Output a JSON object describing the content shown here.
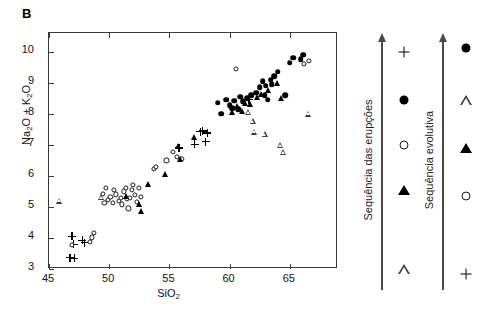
{
  "panel": {
    "label": "B"
  },
  "chart_data": {
    "type": "scatter",
    "title": "",
    "xlabel": "SiO2",
    "ylabel": "Na2O + K2O",
    "xlabel_html": "SiO<sub>2</sub>",
    "ylabel_html": "Na<sub>2</sub>O + K<sub>2</sub>O",
    "xlim": [
      45,
      69
    ],
    "ylim": [
      3,
      10.6
    ],
    "xticks": [
      45,
      50,
      55,
      60,
      65
    ],
    "yticks": [
      3,
      4,
      5,
      6,
      7,
      8,
      9,
      10
    ],
    "grid": false,
    "legend_position": "right-outside",
    "series": [
      {
        "name": "plus",
        "marker": "plus",
        "points": [
          [
            46.9,
            4.05
          ],
          [
            47.05,
            3.8
          ],
          [
            46.75,
            3.37
          ],
          [
            47.1,
            3.35
          ],
          [
            47.75,
            3.92
          ],
          [
            47.95,
            3.85
          ],
          [
            55.8,
            6.9
          ],
          [
            57.1,
            7.02
          ],
          [
            57.55,
            7.42
          ],
          [
            57.75,
            7.45
          ],
          [
            58.15,
            7.38
          ],
          [
            58.0,
            7.1
          ],
          [
            61.6,
            8.45
          ]
        ]
      },
      {
        "name": "open-circle",
        "marker": "open-circle",
        "points": [
          [
            46.9,
            3.78
          ],
          [
            48.55,
            4.02
          ],
          [
            48.75,
            4.15
          ],
          [
            48.4,
            3.88
          ],
          [
            49.5,
            5.42
          ],
          [
            49.75,
            5.6
          ],
          [
            49.6,
            5.12
          ],
          [
            49.9,
            5.22
          ],
          [
            50.1,
            5.33
          ],
          [
            50.3,
            5.12
          ],
          [
            50.55,
            5.4
          ],
          [
            50.4,
            5.55
          ],
          [
            50.8,
            5.18
          ],
          [
            51.0,
            5.28
          ],
          [
            51.2,
            5.5
          ],
          [
            51.4,
            5.62
          ],
          [
            51.05,
            5.08
          ],
          [
            51.5,
            5.25
          ],
          [
            51.75,
            5.3
          ],
          [
            51.9,
            5.55
          ],
          [
            52.1,
            5.38
          ],
          [
            52.3,
            5.15
          ],
          [
            51.6,
            4.95
          ],
          [
            52.6,
            5.32
          ],
          [
            52.0,
            5.72
          ],
          [
            52.45,
            5.62
          ],
          [
            53.7,
            6.22
          ],
          [
            53.9,
            6.3
          ],
          [
            54.75,
            6.5
          ],
          [
            55.3,
            6.78
          ],
          [
            55.6,
            6.62
          ],
          [
            56.0,
            6.55
          ],
          [
            60.5,
            9.45
          ],
          [
            66.2,
            9.6
          ],
          [
            66.6,
            9.7
          ]
        ]
      },
      {
        "name": "filled-triangle",
        "marker": "filled-triangle",
        "points": [
          [
            51.4,
            5.35
          ],
          [
            52.5,
            5.1
          ],
          [
            52.65,
            4.88
          ],
          [
            53.2,
            5.75
          ],
          [
            54.6,
            6.05
          ],
          [
            55.85,
            6.55
          ],
          [
            55.75,
            6.95
          ],
          [
            57.0,
            7.25
          ],
          [
            60.6,
            8.25
          ],
          [
            61.0,
            8.1
          ],
          [
            61.3,
            8.35
          ],
          [
            61.7,
            8.3
          ],
          [
            62.3,
            8.55
          ],
          [
            62.6,
            8.62
          ],
          [
            63.2,
            8.75
          ],
          [
            63.9,
            9.0
          ],
          [
            64.3,
            8.5
          ],
          [
            60.2,
            8.05
          ]
        ]
      },
      {
        "name": "open-triangle",
        "marker": "open-triangle",
        "points": [
          [
            45.85,
            5.2
          ],
          [
            49.3,
            5.5
          ],
          [
            61.55,
            8.45
          ],
          [
            61.9,
            8.35
          ],
          [
            62.05,
            8.2
          ],
          [
            62.9,
            8.3
          ],
          [
            64.2,
            8.15
          ],
          [
            64.45,
            8.12
          ],
          [
            66.5,
            9.55
          ]
        ]
      },
      {
        "name": "filled-circle",
        "marker": "filled-circle",
        "points": [
          [
            59.3,
            8.0
          ],
          [
            59.7,
            8.45
          ],
          [
            60.0,
            8.28
          ],
          [
            60.4,
            8.42
          ],
          [
            60.2,
            8.18
          ],
          [
            60.9,
            8.55
          ],
          [
            61.1,
            8.4
          ],
          [
            61.45,
            8.5
          ],
          [
            61.8,
            8.6
          ],
          [
            62.2,
            8.68
          ],
          [
            62.5,
            8.85
          ],
          [
            62.75,
            9.05
          ],
          [
            63.0,
            8.9
          ],
          [
            63.4,
            9.1
          ],
          [
            63.7,
            9.2
          ],
          [
            63.5,
            8.95
          ],
          [
            64.0,
            9.35
          ],
          [
            64.6,
            8.6
          ],
          [
            65.0,
            9.65
          ],
          [
            65.3,
            9.8
          ],
          [
            65.9,
            9.75
          ],
          [
            66.1,
            9.9
          ],
          [
            59.0,
            8.35
          ],
          [
            62.9,
            8.6
          ],
          [
            63.15,
            8.45
          ],
          [
            60.7,
            8.15
          ]
        ]
      }
    ]
  },
  "legends": [
    {
      "id": "sequencia-das-erupcoes",
      "title": "Sequência das erupções",
      "symbols": [
        "plus",
        "filled-circle",
        "open-circle",
        "filled-triangle",
        "open-triangle"
      ]
    },
    {
      "id": "sequencia-evolutiva",
      "title": "Sequência evolutiva",
      "symbols": [
        "filled-circle",
        "open-triangle",
        "filled-triangle",
        "open-circle",
        "plus"
      ]
    }
  ],
  "colors": {
    "ink": "#000000",
    "axis": "#3a3a3a",
    "arrow": "#4a4a4a"
  }
}
